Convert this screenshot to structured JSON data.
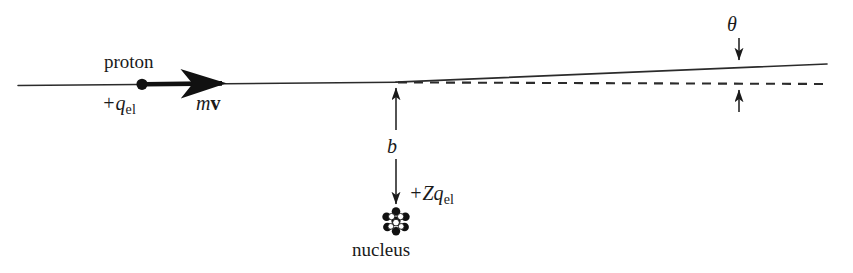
{
  "figure": {
    "background_color": "#ffffff",
    "ink_color": "#1a1a1a"
  },
  "labels": {
    "proton": "proton",
    "proton_charge_symbol": "+q",
    "proton_charge_subscript": "el",
    "momentum_symbol": "m",
    "momentum_vector": "v",
    "impact_parameter": "b",
    "nucleus_charge_symbol": "+Zq",
    "nucleus_charge_subscript": "el",
    "nucleus": "nucleus",
    "scattering_angle": "θ"
  },
  "geometry": {
    "incident_line": {
      "x1": 18,
      "y1": 85,
      "x2": 396,
      "y2": 82
    },
    "deflected_line": {
      "x1": 396,
      "y1": 82,
      "x2": 827,
      "y2": 64
    },
    "dashed_line": {
      "x1": 398,
      "y1": 82,
      "x2": 830,
      "y2": 84
    },
    "scattering_point": {
      "x": 396,
      "y": 82
    },
    "proton_dot": {
      "x": 142,
      "y": 84,
      "r": 5.5
    },
    "velocity_arrow": {
      "x1": 144,
      "y1": 84,
      "x2": 231,
      "y2": 83
    },
    "impact_arrow_up": {
      "x": 396,
      "y_from": 130,
      "y_to": 86
    },
    "impact_arrow_down": {
      "x": 396,
      "y_from": 160,
      "y_to": 208
    },
    "nucleus_cluster": {
      "cx": 396,
      "cy": 221,
      "r": 11
    },
    "theta_arrow_down": {
      "x": 739,
      "y_from": 38,
      "y_to": 64
    },
    "theta_arrow_up": {
      "x": 739,
      "y_from": 112,
      "y_to": 86
    }
  },
  "nucleus_particles": [
    {
      "cx": 396,
      "cy": 212,
      "r": 4.1,
      "fill": "dark"
    },
    {
      "cx": 387,
      "cy": 217,
      "r": 4.1,
      "fill": "dark"
    },
    {
      "cx": 405,
      "cy": 217,
      "r": 4.1,
      "fill": "dark"
    },
    {
      "cx": 388,
      "cy": 227,
      "r": 4.1,
      "fill": "dark"
    },
    {
      "cx": 404,
      "cy": 227,
      "r": 4.1,
      "fill": "dark"
    },
    {
      "cx": 396,
      "cy": 231,
      "r": 4.0,
      "fill": "dark"
    },
    {
      "cx": 392,
      "cy": 217,
      "r": 3.5,
      "fill": "light"
    },
    {
      "cx": 401,
      "cy": 221,
      "r": 3.6,
      "fill": "light"
    },
    {
      "cx": 391,
      "cy": 226,
      "r": 3.2,
      "fill": "light"
    },
    {
      "cx": 396,
      "cy": 219,
      "r": 3.3,
      "fill": "light"
    }
  ]
}
